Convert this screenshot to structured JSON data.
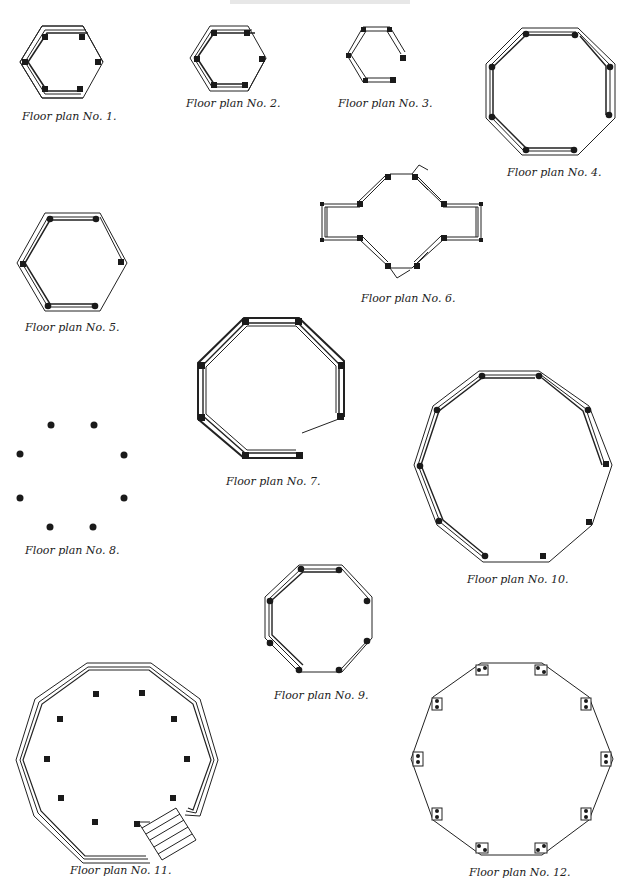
{
  "page": {
    "title_cutoff": "",
    "captions": {
      "p1": "Floor plan No. 1.",
      "p2": "Floor plan No. 2.",
      "p3": "Floor plan No. 3.",
      "p4": "Floor plan No. 4.",
      "p5": "Floor plan No. 5.",
      "p6": "Floor plan No. 6.",
      "p7": "Floor plan No. 7.",
      "p8": "Floor plan No. 8.",
      "p9": "Floor plan No. 9.",
      "p10": "Floor plan No. 10.",
      "p11": "Floor plan No. 11.",
      "p12": "Floor plan No. 12."
    }
  },
  "plans": [
    {
      "id": 1,
      "shape": "hexagon",
      "walls": "5 of 6 sides railed",
      "posts": 6
    },
    {
      "id": 2,
      "shape": "hexagon",
      "walls": "4 of 6 sides railed",
      "posts": 6
    },
    {
      "id": 3,
      "shape": "hexagon (open)",
      "walls": "4 sides, one side open",
      "posts": 6
    },
    {
      "id": 4,
      "shape": "octagon",
      "walls": "7 of 8 sides railed",
      "posts": 8
    },
    {
      "id": 5,
      "shape": "hexagon",
      "walls": "5 of 6 sides railed",
      "posts": 6
    },
    {
      "id": 6,
      "shape": "octagon with two side wings",
      "walls": "railed diagonals, two entrances",
      "posts": 12
    },
    {
      "id": 7,
      "shape": "octagon",
      "walls": "heavy walls, one entrance",
      "posts": 8
    },
    {
      "id": 8,
      "shape": "octagon (posts only)",
      "walls": "none",
      "posts": 8
    },
    {
      "id": 9,
      "shape": "octagon",
      "walls": "6 of 8 sides railed",
      "posts": 8
    },
    {
      "id": 10,
      "shape": "decagon",
      "walls": "7 of 10 sides railed",
      "posts": 10
    },
    {
      "id": 11,
      "shape": "decagon with steps",
      "walls": "triple-line walls, stair entrance",
      "posts": 10
    },
    {
      "id": 12,
      "shape": "decagon",
      "walls": "single line with bracket posts",
      "posts": 10
    }
  ]
}
